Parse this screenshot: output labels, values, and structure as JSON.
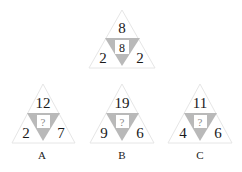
{
  "puzzle": {
    "example": {
      "top": "8",
      "left": "2",
      "right": "2",
      "center": "8"
    },
    "options": [
      {
        "label": "A",
        "top": "12",
        "left": "2",
        "right": "7",
        "center": "?"
      },
      {
        "label": "B",
        "top": "19",
        "left": "9",
        "right": "6",
        "center": "?"
      },
      {
        "label": "C",
        "top": "11",
        "left": "4",
        "right": "6",
        "center": "?"
      }
    ]
  },
  "colors": {
    "outer_fill": "#ffffff",
    "outer_stroke": "#e6e6e6",
    "inner_fill": "#b9b9b9",
    "center_box": "#ffffff"
  }
}
